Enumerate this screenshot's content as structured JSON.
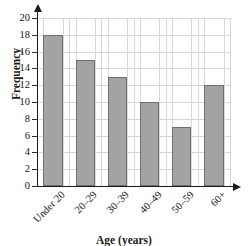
{
  "chart_data": {
    "type": "bar",
    "title": "",
    "subtitle": "",
    "xlabel": "Age (years)",
    "ylabel": "Frequency",
    "categories": [
      "Under 20",
      "20–29",
      "30–39",
      "40–49",
      "50–59",
      "60+"
    ],
    "values": [
      18,
      15,
      13,
      10,
      7,
      12
    ],
    "series": [
      {
        "name": "Frequency",
        "values": [
          18,
          15,
          13,
          10,
          7,
          12
        ]
      }
    ],
    "ylim": [
      0,
      20
    ],
    "ytick_step": 2,
    "ytick_labels": [
      "0",
      "2",
      "4",
      "6",
      "8",
      "10",
      "12",
      "14",
      "16",
      "18",
      "20"
    ],
    "ytick_values": [
      0,
      2,
      4,
      6,
      8,
      10,
      12,
      14,
      16,
      18,
      20
    ],
    "grid": true,
    "grid_axes": "both",
    "legend": false,
    "legend_position": "none",
    "annotations": [],
    "xlabel_rotation_degrees": -45,
    "ylabel_rotation_degrees": -90,
    "axis_arrows": true,
    "colors": {
      "bar_fill": "#a3a3a3",
      "bar_stroke": "#6f6f6f",
      "gridline": "#d8d8d8",
      "axis": "#1a1a1a",
      "text": "#141414",
      "background": "#ffffff"
    }
  }
}
